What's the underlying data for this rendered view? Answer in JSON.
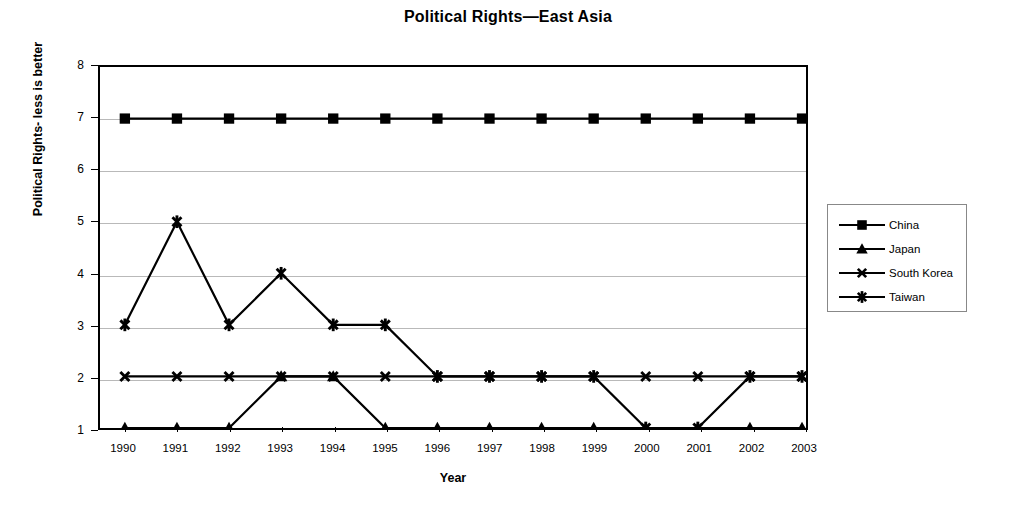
{
  "chart_data": {
    "type": "line",
    "title": "Political Rights—East Asia",
    "xlabel": "Year",
    "ylabel": "Political Rights- less is better",
    "categories": [
      "1990",
      "1991",
      "1992",
      "1993",
      "1994",
      "1995",
      "1996",
      "1997",
      "1998",
      "1999",
      "2000",
      "2001",
      "2002",
      "2003"
    ],
    "yticks": [
      "1",
      "2",
      "3",
      "4",
      "5",
      "6",
      "7",
      "8"
    ],
    "ylim": [
      1,
      8
    ],
    "grid": true,
    "legend_position": "right",
    "series": [
      {
        "name": "China",
        "marker": "square",
        "color": "#000000",
        "values": [
          7,
          7,
          7,
          7,
          7,
          7,
          7,
          7,
          7,
          7,
          7,
          7,
          7,
          7
        ]
      },
      {
        "name": "Japan",
        "marker": "triangle",
        "color": "#000000",
        "values": [
          1,
          1,
          1,
          2,
          2,
          1,
          1,
          1,
          1,
          1,
          1,
          1,
          1,
          1
        ]
      },
      {
        "name": "South Korea",
        "marker": "cross",
        "color": "#000000",
        "values": [
          2,
          2,
          2,
          2,
          2,
          2,
          2,
          2,
          2,
          2,
          2,
          2,
          2,
          2
        ]
      },
      {
        "name": "Taiwan",
        "marker": "star",
        "color": "#000000",
        "values": [
          3,
          5,
          3,
          4,
          3,
          3,
          2,
          2,
          2,
          2,
          1,
          1,
          2,
          2
        ]
      }
    ]
  },
  "legend": {
    "items": [
      {
        "label": "China"
      },
      {
        "label": "Japan"
      },
      {
        "label": "South Korea"
      },
      {
        "label": "Taiwan"
      }
    ]
  }
}
